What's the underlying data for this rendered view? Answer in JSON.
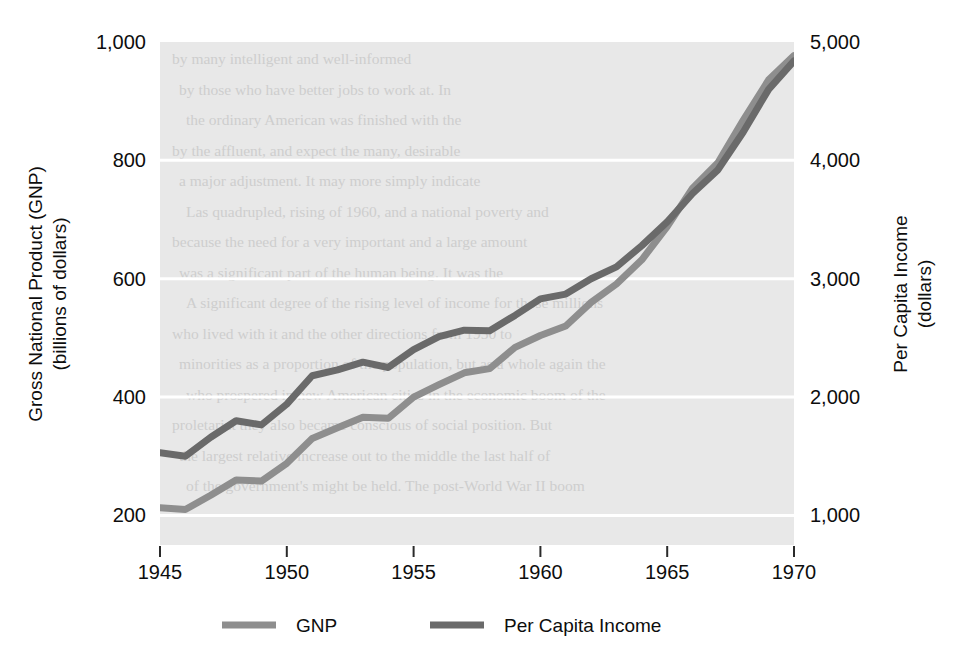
{
  "chart_data": {
    "type": "line",
    "title": "",
    "subtitle": "",
    "xlabel": "",
    "ylabel": "Gross National Product (GNP)",
    "y2label": "Per Capita Income",
    "grid": true,
    "legend_position": "bottom",
    "x": [
      1945,
      1946,
      1947,
      1948,
      1949,
      1950,
      1951,
      1952,
      1953,
      1954,
      1955,
      1956,
      1957,
      1958,
      1959,
      1960,
      1961,
      1962,
      1963,
      1964,
      1965,
      1966,
      1967,
      1968,
      1969,
      1970
    ],
    "xlim": [
      1945,
      1970
    ],
    "xticks": [
      1945,
      1950,
      1955,
      1960,
      1965,
      1970
    ],
    "xticklabels": [
      "1945",
      "1950",
      "1955",
      "1960",
      "1965",
      "1970"
    ],
    "ylim": [
      150,
      1000
    ],
    "yticks": [
      200,
      400,
      600,
      800,
      1000
    ],
    "yticklabels": [
      "200",
      "400",
      "600",
      "800",
      "1,000"
    ],
    "y2lim": [
      750,
      5000
    ],
    "y2ticks": [
      1000,
      2000,
      3000,
      4000,
      5000
    ],
    "y2ticklabels": [
      "1,000",
      "2,000",
      "3,000",
      "4,000",
      "5,000"
    ],
    "series": [
      {
        "name": "GNP",
        "axis": "left",
        "units": "billions of dollars",
        "color": "#8e8e8e",
        "values": [
          213,
          210,
          234,
          260,
          258,
          288,
          330,
          348,
          366,
          364,
          400,
          421,
          441,
          448,
          484,
          504,
          520,
          560,
          591,
          632,
          688,
          753,
          796,
          868,
          936,
          977
        ]
      },
      {
        "name": "Per Capita Income",
        "axis": "right",
        "units": "dollars",
        "color": "#6a6a6a",
        "values": [
          1530,
          1500,
          1660,
          1800,
          1765,
          1940,
          2180,
          2230,
          2295,
          2250,
          2400,
          2510,
          2565,
          2560,
          2690,
          2830,
          2870,
          3000,
          3100,
          3280,
          3480,
          3720,
          3920,
          4240,
          4600,
          4840
        ]
      }
    ]
  },
  "axes": {
    "left": {
      "title_line1": "Gross National Product (GNP)",
      "title_line2": "(billions of dollars)"
    },
    "right": {
      "title_line1": "Per Capita Income",
      "title_line2": "(dollars)"
    }
  },
  "legend": {
    "items": [
      {
        "label": "GNP",
        "swatch_color": "#8e8e8e"
      },
      {
        "label": "Per Capita Income",
        "swatch_color": "#6a6a6a"
      }
    ]
  },
  "style": {
    "plot_background": "#e8e8e8",
    "gridline_color": "#ffffff",
    "page_background": "#ffffff",
    "text_color": "#0d0d0d"
  },
  "background_text": {
    "note": "faint show-through of printed text from reverse page",
    "lines": [
      "by many intelligent and well-informed",
      "by those who have better jobs to work at. In",
      "the ordinary American was finished with the",
      "by the affluent, and expect the many, desirable",
      "a major adjustment. It may more simply indicate",
      "Las quadrupled, rising of 1960, and a national poverty and",
      "because the need for a very important and a large amount",
      "was a significant part of the human being. It was the",
      "A significant degree of the rising level of income for those millions",
      "who lived with it and the other directions from 1950 to",
      "minorities as a proportion of the population, but as a whole again the",
      "who prospered in new American cities in the economic boom of the",
      "proletariat they also became conscious of social position. But",
      "the largest relative increase out to the middle the last half of",
      "of the government's might be held. The post-World War II boom"
    ]
  }
}
